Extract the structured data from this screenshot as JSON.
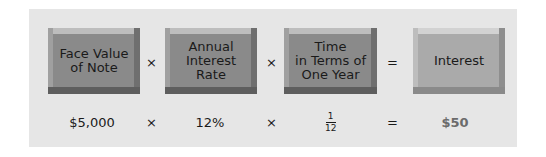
{
  "diagram": {
    "boxes": [
      {
        "label": "Face Value\nof Note"
      },
      {
        "label": "Annual\nInterest\nRate"
      },
      {
        "label": "Time\nin Terms of\nOne Year"
      },
      {
        "label": "Interest"
      }
    ],
    "operators": [
      "×",
      "×",
      "=",
      "×",
      "×",
      "="
    ],
    "values": {
      "face_value": "$5,000",
      "rate": "12%",
      "time_numerator": "1",
      "time_denominator": "12",
      "interest": "$50"
    }
  }
}
